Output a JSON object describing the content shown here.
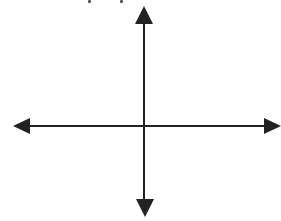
{
  "diagram": {
    "type": "coordinate-axes",
    "origin": {
      "x": 144,
      "y": 126
    },
    "colors": {
      "line": "#222222",
      "background": "#ffffff"
    },
    "axes": {
      "horizontal": {
        "x1": 13,
        "x2": 281,
        "y": 126,
        "arrows": [
          "left",
          "right"
        ]
      },
      "vertical": {
        "x": 144,
        "y1": 6,
        "y2": 217,
        "arrows": [
          "up",
          "down"
        ]
      }
    },
    "labels": []
  }
}
